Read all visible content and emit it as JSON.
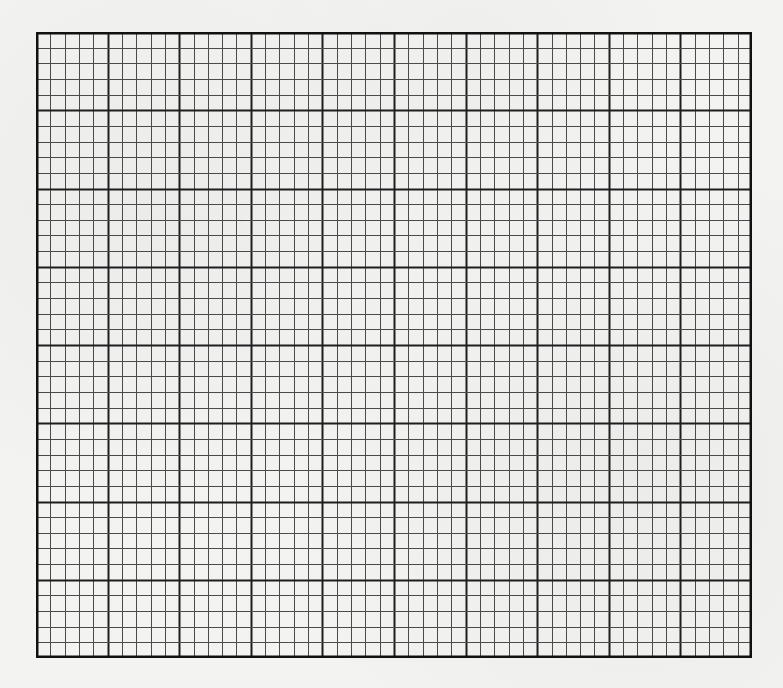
{
  "sheet": {
    "type": "graph-paper",
    "grid": {
      "left": 36,
      "top": 32,
      "width": 716,
      "height": 626,
      "columns": 50,
      "rows": 40,
      "major_every": 5,
      "minor_color": "#4a4a4a",
      "major_color": "#1e1e1e",
      "border_color": "#111111"
    },
    "background_color": "#f3f3f2"
  }
}
